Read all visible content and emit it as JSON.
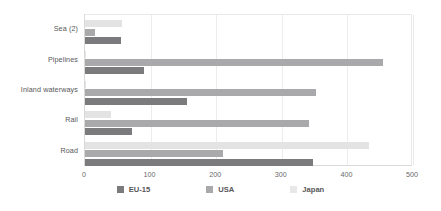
{
  "chart_data": {
    "type": "bar",
    "orientation": "horizontal",
    "title": "",
    "subtitle": "",
    "xlabel": "",
    "ylabel": "",
    "xlim": [
      0,
      500
    ],
    "xticks": [
      0,
      100,
      200,
      300,
      400,
      500
    ],
    "xtick_labels": [
      "0",
      "100",
      "200",
      "300",
      "400",
      "500"
    ],
    "grid": true,
    "grid_axis": "x",
    "legend_position": "bottom",
    "categories": [
      "Sea (2)",
      "Pipelines",
      "Inland waterways",
      "Rail",
      "Road"
    ],
    "series": [
      {
        "name": "EU-15",
        "color": "#7b7b7d",
        "values": [
          55,
          90,
          155,
          72,
          348
        ]
      },
      {
        "name": "USA",
        "color": "#a9a9ab",
        "values": [
          15,
          455,
          352,
          342,
          210
        ]
      },
      {
        "name": "Japan",
        "color": "#e3e3e3",
        "values": [
          57,
          1,
          1,
          40,
          433
        ]
      }
    ]
  },
  "legend": {
    "items": [
      {
        "label": "EU-15",
        "swatch": "eu"
      },
      {
        "label": "USA",
        "swatch": "usa"
      },
      {
        "label": "Japan",
        "swatch": "japan"
      }
    ]
  },
  "colors": {
    "eu15": "#7b7b7d",
    "usa": "#a9a9ab",
    "japan": "#e3e3e3",
    "grid": "#ececec",
    "axis": "#d9d9d9",
    "text": "#58585a",
    "background": "#ffffff"
  }
}
